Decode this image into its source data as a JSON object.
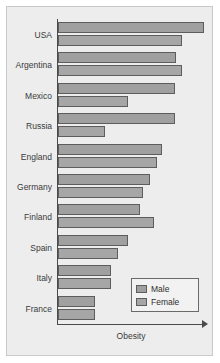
{
  "chart_data": {
    "type": "bar",
    "orientation": "horizontal",
    "title": "",
    "xlabel": "Obesity",
    "ylabel": "",
    "grid": false,
    "legend_position": "bottom-right",
    "axis_arrow": true,
    "xlim": [
      0,
      100
    ],
    "categories": [
      "USA",
      "Argentina",
      "Mexico",
      "Russia",
      "England",
      "Germany",
      "Finland",
      "Spain",
      "Italy",
      "France"
    ],
    "series": [
      {
        "name": "Male",
        "color": "#a0a0a0",
        "values": [
          100,
          81,
          80,
          80,
          71,
          63,
          56,
          48,
          36,
          25
        ]
      },
      {
        "name": "Female",
        "color": "#a6a6a6",
        "values": [
          85,
          85,
          48,
          32,
          68,
          58,
          66,
          41,
          36,
          25
        ]
      }
    ],
    "tick_labels": [],
    "annotations": []
  },
  "legend": {
    "items": [
      {
        "label": "Male",
        "swatch": "male-swatch"
      },
      {
        "label": "Female",
        "swatch": "female-swatch"
      }
    ]
  },
  "colors": {
    "figure_background": "#ffffff",
    "plot_background": "#ededed",
    "frame_border": "#c9c9c9",
    "axis": "#4a4a4a",
    "bar_edge": "#5d5d5d",
    "male_fill": "#a0a0a0",
    "female_fill": "#a6a6a6",
    "legend_background": "#f2f2f2",
    "legend_border": "#6a6a6a",
    "text": "#3a3a3a"
  }
}
